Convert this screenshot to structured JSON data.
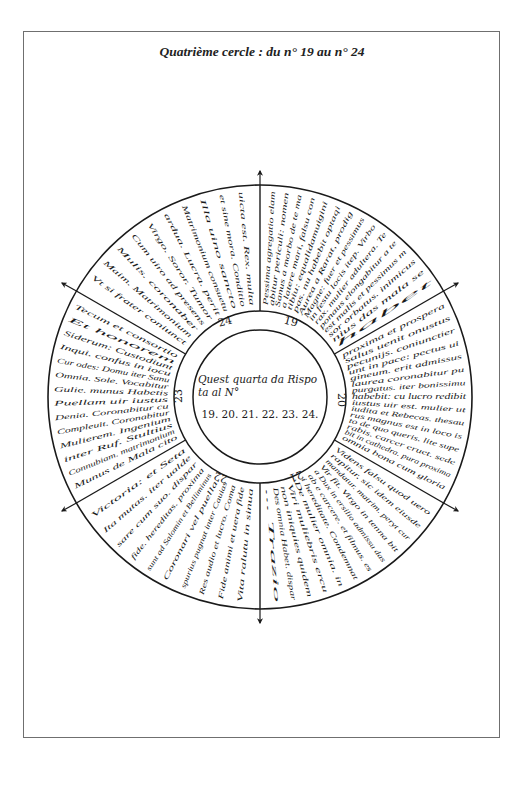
{
  "page": {
    "title": "Quatrième cercle : du n° 19 au n° 24"
  },
  "diagram": {
    "type": "circular divination wheel",
    "center_text": {
      "line1": "Quest quarta da Rispo",
      "line2": "ta al N°",
      "numbers": "19. 20. 21. 22. 23. 24."
    },
    "sectors": [
      {
        "number": "19",
        "lines": [
          "Pessima agregatio elam",
          "abitur periculi: nomen",
          "Sanus a morbo de te ma",
          "a latere mari, falsu con",
          "tibiu: equalidamuigini",
          "pas. nu habebit optaqi",
          "Aurea a Rarat, prodig",
          "Magne: fuer et pessimus",
          "in festu locis itep. Virbo",
          "rax. mulier adultera. Te",
          "ponaus elongabitur a te",
          "est malis et pessimus m",
          "sor orbatus. inimicus",
          "nius das mala se",
          "habet"
        ]
      },
      {
        "number": "20",
        "lines": [
          "proxima et prospera",
          "salus uenit onustus",
          "pecunijs. coniunctier",
          "unt in pace: pectus ui",
          "gineum. erit admissus",
          "laurea coronabitur pu",
          "purgatus. iter bonissimu",
          "habebit: cu lucro redibit",
          "iustus uir est. mulier ut",
          "iudita et Rebecas. thesau",
          "rus magnus est in loco is",
          "to de quo queris. lite supe",
          "rabis. carcer eruet. sede",
          "bit in cathedra. pura proxima",
          "omnia bona cum gloria"
        ]
      },
      {
        "number": "21",
        "lines": [
          "Videns falsu quod uero",
          "rapitur, sic idem eiusde",
          "mandatur. matrim. peryt cur",
          "Vir fit. Virgo in tenna bit",
          "a Dux in ersilio admissu das",
          "ab e carcere. et filmus. es",
          "i hereditate. Condemnat",
          "De mulier omnia. in",
          "Viri muliebris ercu",
          "non iniquies quidem",
          "Des omnia Habet. dispar",
          "... Trazio"
        ]
      },
      {
        "number": "22",
        "lines": [
          "Vita ralutu in sinua",
          "Fide animi et uera fide",
          "Res audio et lucro. Coma",
          "spurius pugnat inter Cauias",
          "Coronari vel puella.",
          "sunt ad Salomin et Belliminus",
          "fide. hereditas. proxima",
          "sare cum suo. dispar",
          "Ita mutas. iter ualde",
          "Victoria: et Seta"
        ]
      },
      {
        "number": "23",
        "lines": [
          "Munus de Mala cito",
          "Connubiam. matrimonium",
          "inter Ruf. Stultius",
          "Mulierem. Ingenium",
          "Compleuit. Coronabitur",
          "Denia. Coronabitur cu",
          "Puellam uir iustus",
          "Gulie. munus Habetis",
          "Omnia. Sole. Vocabitur",
          "Cur odes: Domu iter Sanu",
          "Inqui. confus in iocu",
          "Siderum: Custodiunt",
          "Et honorem",
          "Tecum et consortio"
        ]
      },
      {
        "number": "24",
        "lines": [
          "Vt si frater coniunct",
          "Maim. Matrimonium",
          "Mulis. coronaber",
          "Cum uiro ad presens",
          "Virgo. Soror. Tumor",
          "ardua. Lucra. perit",
          "Matrimonium consuetu",
          "Illa uino sancto",
          "et sine mora. Conditio",
          "uicta est. Rex. multa"
        ]
      }
    ],
    "compass_arrows": [
      "north",
      "south",
      "east-northeast",
      "west-northwest",
      "east-southeast",
      "west-southwest"
    ]
  }
}
